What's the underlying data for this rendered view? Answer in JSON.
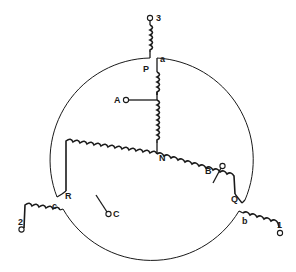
{
  "diagram": {
    "type": "three-phase star (wye) winding with auto-transformer taps",
    "colors": {
      "ink": "#1a1a1a",
      "background": "#ffffff"
    },
    "labels": {
      "terminal_1": "1",
      "terminal_2": "2",
      "terminal_3": "3",
      "line_a": "a",
      "line_b": "b",
      "line_c": "c",
      "node_P": "P",
      "node_Q": "Q",
      "node_R": "R",
      "neutral": "N",
      "tap_A": "A",
      "tap_B": "B",
      "tap_C": "C"
    }
  }
}
